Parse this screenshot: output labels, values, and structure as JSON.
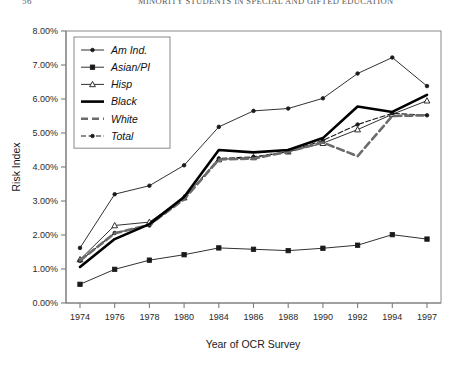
{
  "running_head": {
    "page_number": "56",
    "title": "MINORITY STUDENTS IN SPECIAL AND GIFTED EDUCATION"
  },
  "chart_data": {
    "type": "line",
    "title": "",
    "xlabel": "Year of OCR Survey",
    "ylabel": "Risk Index",
    "categories": [
      "1974",
      "1976",
      "1978",
      "1980",
      "1984",
      "1986",
      "1988",
      "1990",
      "1992",
      "1994",
      "1997"
    ],
    "ylim": [
      0,
      8
    ],
    "ytick_labels": [
      "0.00%",
      "1.00%",
      "2.00%",
      "3.00%",
      "4.00%",
      "5.00%",
      "6.00%",
      "7.00%",
      "8.00%"
    ],
    "ytick_values": [
      0,
      1,
      2,
      3,
      4,
      5,
      6,
      7,
      8
    ],
    "grid": false,
    "legend_position": "top-left",
    "series": [
      {
        "name": "Am Ind.",
        "marker": "dot",
        "style": "thin-solid",
        "values": [
          1.62,
          3.2,
          3.45,
          4.05,
          5.18,
          5.65,
          5.72,
          6.02,
          6.75,
          7.22,
          6.38
        ]
      },
      {
        "name": "Asian/PI",
        "marker": "square",
        "style": "thin-solid",
        "values": [
          0.55,
          0.99,
          1.26,
          1.42,
          1.62,
          1.58,
          1.54,
          1.61,
          1.7,
          2.01,
          1.88
        ]
      },
      {
        "name": "Hisp",
        "marker": "triangle",
        "style": "thin-solid",
        "values": [
          1.28,
          2.28,
          2.38,
          3.1,
          4.22,
          4.28,
          4.45,
          4.7,
          5.1,
          5.55,
          5.95
        ]
      },
      {
        "name": "Black",
        "marker": "none",
        "style": "thick-solid",
        "values": [
          1.06,
          1.88,
          2.32,
          3.12,
          4.5,
          4.43,
          4.5,
          4.85,
          5.78,
          5.62,
          6.12
        ]
      },
      {
        "name": "White",
        "marker": "none",
        "style": "thick-dashed",
        "values": [
          1.25,
          2.05,
          2.3,
          3.05,
          4.22,
          4.25,
          4.45,
          4.72,
          4.32,
          5.5,
          5.52
        ]
      },
      {
        "name": "Total",
        "marker": "dot",
        "style": "thin-dashed",
        "values": [
          1.24,
          2.06,
          2.28,
          3.08,
          4.25,
          4.3,
          4.45,
          4.78,
          5.25,
          5.58,
          5.52
        ]
      }
    ]
  }
}
